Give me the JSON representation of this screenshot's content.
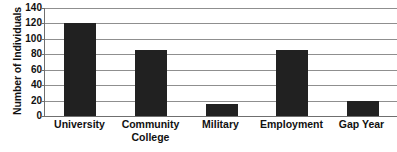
{
  "chart_data": {
    "type": "bar",
    "title": "",
    "xlabel": "",
    "ylabel": "Number of Individuals",
    "categories": [
      "University",
      "Community College",
      "Military",
      "Employment",
      "Gap Year"
    ],
    "category_lines": [
      [
        "University"
      ],
      [
        "Community",
        "College"
      ],
      [
        "Military"
      ],
      [
        "Employment"
      ],
      [
        "Gap Year"
      ]
    ],
    "values": [
      120,
      85,
      15,
      85,
      20
    ],
    "ylim": [
      0,
      140
    ],
    "yticks": [
      0,
      20,
      40,
      60,
      80,
      100,
      120,
      140
    ],
    "ytick_labels": [
      "0",
      "20",
      "40",
      "60",
      "80",
      "100",
      "120",
      "140"
    ],
    "grid": true,
    "grid_orientation": "horizontal",
    "legend": false,
    "legend_position": "none",
    "bar_color": "#212121",
    "axis_color": "#6f6f6f",
    "grid_color": "#8f8f8f",
    "text_color": "#111111",
    "background": "#ffffff"
  }
}
